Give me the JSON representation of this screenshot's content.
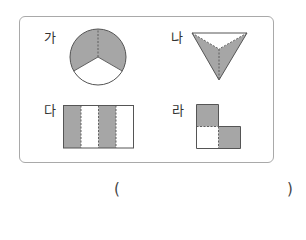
{
  "figures": [
    {
      "label": "가",
      "shape": "circle",
      "parts": 3,
      "shaded_parts": 2
    },
    {
      "label": "나",
      "shape": "triangle",
      "parts": 3,
      "shaded_parts": 2
    },
    {
      "label": "다",
      "shape": "rectangle",
      "parts": 4,
      "shaded_parts": 2
    },
    {
      "label": "라",
      "shape": "l-shape",
      "parts": 3,
      "shaded_parts": 2
    }
  ],
  "answer": {
    "open": "(",
    "close": ")",
    "value": ""
  },
  "colors": {
    "shade": "#a6a6a6",
    "line": "#555555",
    "frame": "#a9a9a9"
  }
}
